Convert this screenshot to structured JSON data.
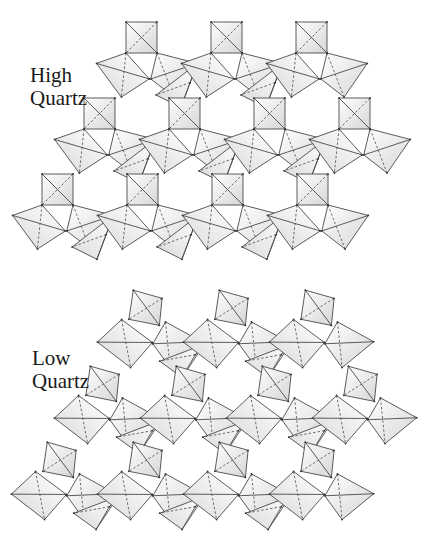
{
  "figure": {
    "background": "#ffffff",
    "stroke_color": "#4a4a4a",
    "fill_light": "#ffffff",
    "fill_shade": "#d9d9d9",
    "panels": [
      {
        "id": "high",
        "label_lines": [
          "High",
          "Quartz"
        ],
        "description": "Hexagonal framework of SiO4 tetrahedra, idealized (high-temperature form)",
        "lattice": {
          "origin_x": 126,
          "origin_y": 22,
          "period_x": 85,
          "row_dy": 76,
          "row_shift_x": -42,
          "square_size": 31,
          "rows": 3,
          "cols_per_row": [
            3,
            4,
            4
          ],
          "twist": 0
        }
      },
      {
        "id": "low",
        "label_lines": [
          "Low",
          "Quartz"
        ],
        "description": "Distorted ditrigonal framework of SiO4 tetrahedra (low-temperature form)",
        "lattice": {
          "origin_x": 130,
          "origin_y": 293,
          "period_x": 86,
          "row_dy": 76,
          "row_shift_x": -43,
          "square_size": 31,
          "rows": 3,
          "cols_per_row": [
            3,
            4,
            4
          ],
          "twist": 0.28
        }
      }
    ]
  }
}
